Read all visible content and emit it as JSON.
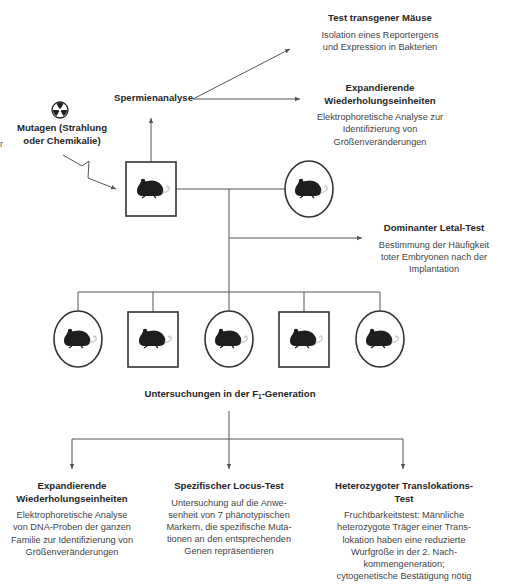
{
  "diagram": {
    "mutagen": {
      "label": "Mutagen (Strahlung\noder Chemikalie)",
      "icon": "radiation-icon"
    },
    "sperm_analysis": {
      "label": "Spermienanalyse"
    },
    "parents": {
      "male": {
        "shape": "square",
        "icon": "mouse-icon"
      },
      "female": {
        "shape": "circle",
        "icon": "mouse-icon"
      }
    },
    "top_tests": [
      {
        "title": "Test transgener Mäuse",
        "description": "Isolation eines Reportergens\nund Expression in Bakterien"
      },
      {
        "title": "Expandierende\nWiederholungseinheiten",
        "description": "Elektrophoretische Analyse zur\nIdentifizierung von\nGrößenveränderungen"
      },
      {
        "title": "Dominanter Letal-Test",
        "description": "Bestimmung der Häufigkeit\ntoter Embryonen nach der\nImplantation"
      }
    ],
    "offspring": [
      {
        "shape": "circle",
        "icon": "mouse-icon"
      },
      {
        "shape": "square",
        "icon": "mouse-icon"
      },
      {
        "shape": "circle",
        "icon": "mouse-icon"
      },
      {
        "shape": "square",
        "icon": "mouse-icon"
      },
      {
        "shape": "circle",
        "icon": "mouse-icon"
      }
    ],
    "f1_label": {
      "prefix": "Untersuchungen in der F",
      "subscript": "1",
      "suffix": "-Generation"
    },
    "bottom_tests": [
      {
        "title": "Expandierende\nWiederholungseinheiten",
        "description": "Elektrophoretische Analyse\nvon DNA-Proben der ganzen\nFamilie zur Identifizierung von\nGrößenveränderungen"
      },
      {
        "title": "Spezifischer Locus-Test",
        "description": "Untersuchung auf die Anwe-\nsenheit von 7 phänotypischen\nMarkern, die spezifische Muta-\ntionen an den entsprechenden\nGenen repräsentieren"
      },
      {
        "title": "Heterozygoter Translokations-\nTest",
        "description": "Fruchtbarkeitstest: Männliche\nheterozygote Träger einer Trans-\nlokation haben eine reduzierte\nWurfgröße in der 2. Nach-\nkommengeneration;\ncytogenetische Bestätigung nötig"
      }
    ],
    "stray_glyph": "r",
    "colors": {
      "line": "#555555",
      "shape_stroke": "#333333",
      "mouse": "#1e1e1e",
      "text": "#333333"
    }
  }
}
